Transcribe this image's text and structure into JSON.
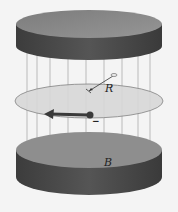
{
  "diagram": {
    "labels": {
      "radius": "R",
      "field": "B",
      "charge": "−"
    },
    "colors": {
      "background": "#f4f4f4",
      "pole_top_face": "#8c8c8c",
      "pole_side": "#4a4a4a",
      "orbit_fill": "#d8d8d8",
      "orbit_stroke": "#7a7a7a",
      "field_line": "#9a9a9a",
      "velocity_arrow": "#3a3a3a"
    },
    "elements": [
      "upper-magnet-pole",
      "field-lines",
      "circular-orbit",
      "radius-arrow",
      "electron",
      "velocity-arrow",
      "lower-magnet-pole"
    ]
  }
}
